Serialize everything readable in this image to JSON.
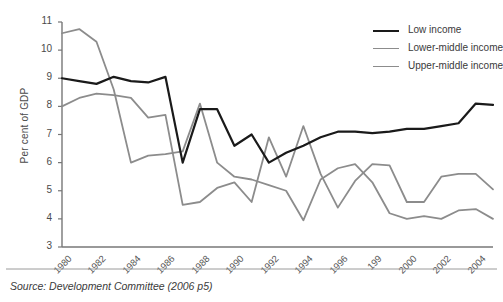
{
  "figure": {
    "source_note": "Source: Development Committee (2006 p5)",
    "background": "#ffffff"
  },
  "chart_data": {
    "type": "line",
    "title": "",
    "xlabel": "",
    "ylabel": "Per cent of GDP",
    "xlim": [
      1980,
      2005
    ],
    "ylim": [
      3,
      11
    ],
    "grid": false,
    "legend_position": "top-right",
    "y_ticks": [
      11,
      10,
      9,
      8,
      7,
      6,
      5,
      4,
      3
    ],
    "x_ticks": [
      1980,
      1982,
      1984,
      1986,
      1988,
      1990,
      1992,
      1994,
      1996,
      1998,
      2000,
      2002,
      2004
    ],
    "x_tick_labels": [
      "1980",
      "1982",
      "1984",
      "1986",
      "1988",
      "1990",
      "1992",
      "1994",
      "1996",
      "199",
      "2000",
      "2002",
      "2004"
    ],
    "x": [
      1980,
      1981,
      1982,
      1983,
      1984,
      1985,
      1986,
      1987,
      1988,
      1989,
      1990,
      1991,
      1992,
      1993,
      1994,
      1995,
      1996,
      1997,
      1998,
      1999,
      2000,
      2001,
      2002,
      2003,
      2004,
      2005
    ],
    "series": [
      {
        "name": "Low income",
        "color": "#1a1a1a",
        "width": 2.2,
        "values": [
          9.0,
          8.9,
          8.8,
          9.05,
          8.9,
          8.85,
          9.05,
          6.0,
          7.9,
          7.9,
          6.6,
          7.0,
          6.0,
          6.35,
          6.6,
          6.9,
          7.1,
          7.1,
          7.05,
          7.1,
          7.2,
          7.2,
          7.3,
          7.4,
          8.1,
          8.05
        ]
      },
      {
        "name": "Lower-middle income",
        "color": "#8c8c8c",
        "width": 1.8,
        "values": [
          8.0,
          8.3,
          8.45,
          8.4,
          8.3,
          7.6,
          7.7,
          4.5,
          4.6,
          5.1,
          5.3,
          4.6,
          6.9,
          5.5,
          7.3,
          5.6,
          4.4,
          5.35,
          5.95,
          5.9,
          4.6,
          4.6,
          5.5,
          5.6,
          5.6,
          5.05
        ]
      },
      {
        "name": "Upper-middle income",
        "color": "#8c8c8c",
        "width": 1.8,
        "values": [
          10.6,
          10.75,
          10.3,
          8.6,
          6.0,
          6.25,
          6.3,
          6.4,
          8.1,
          6.0,
          5.5,
          5.4,
          5.2,
          5.0,
          3.95,
          5.4,
          5.8,
          5.95,
          5.3,
          4.2,
          4.0,
          4.1,
          4.0,
          4.3,
          4.35,
          4.0
        ]
      }
    ]
  },
  "legend": {
    "entries": [
      {
        "label": "Low income",
        "color": "#1a1a1a"
      },
      {
        "label": "Lower-middle income",
        "color": "#8c8c8c"
      },
      {
        "label": "Upper-middle income",
        "color": "#8c8c8c"
      }
    ]
  }
}
